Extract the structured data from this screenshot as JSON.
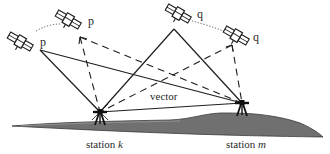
{
  "diagram": {
    "type": "gps-relative-positioning",
    "colors": {
      "line": "#1e1e1e",
      "ground_fill": "#6e6e6e",
      "ground_edge": "#3a3a3a",
      "label": "#2a2a2a",
      "background": "#ffffff"
    },
    "satellites": [
      {
        "id": "p1",
        "label": "p",
        "x": 20,
        "y": 42,
        "label_x": 40,
        "label_y": 46,
        "anchor_x": 40,
        "anchor_y": 50,
        "line_style": "solid"
      },
      {
        "id": "p2",
        "label": "p",
        "x": 68,
        "y": 20,
        "label_x": 88,
        "label_y": 25,
        "anchor_x": 80,
        "anchor_y": 37,
        "line_style": "dashed"
      },
      {
        "id": "q1",
        "label": "q",
        "x": 178,
        "y": 14,
        "label_x": 197,
        "label_y": 18,
        "anchor_x": 174,
        "anchor_y": 29,
        "line_style": "solid"
      },
      {
        "id": "q2",
        "label": "q",
        "x": 236,
        "y": 36,
        "label_x": 253,
        "label_y": 41,
        "anchor_x": 232,
        "anchor_y": 45,
        "line_style": "dashed"
      }
    ],
    "stations": [
      {
        "id": "k",
        "prefix": "station ",
        "name": "k",
        "x": 100,
        "y": 112,
        "label_x": 86,
        "label_y": 148
      },
      {
        "id": "m",
        "prefix": "station ",
        "name": "m",
        "x": 242,
        "y": 103,
        "label_x": 226,
        "label_y": 148
      }
    ],
    "vector": {
      "label": "vector",
      "label_x": 150,
      "label_y": 100
    },
    "arcs": [
      {
        "between": [
          "p1",
          "p2"
        ],
        "style": "dotted"
      },
      {
        "between": [
          "q1",
          "q2"
        ],
        "style": "dotted"
      }
    ]
  }
}
